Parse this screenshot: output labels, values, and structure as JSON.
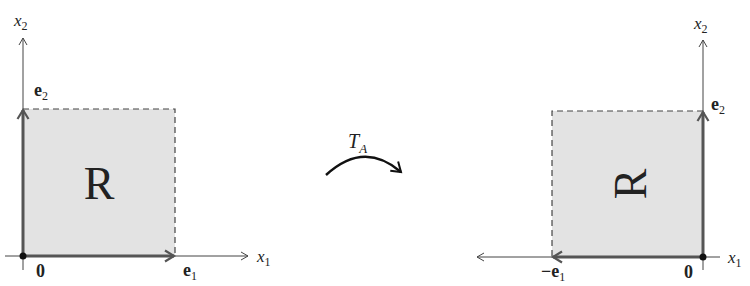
{
  "colors": {
    "fill": "#e3e3e3",
    "vector": "#555555",
    "axis": "#444444",
    "text": "#222222"
  },
  "left_panel": {
    "axis_x_label": "x",
    "axis_x_sub": "1",
    "axis_y_label": "x",
    "axis_y_sub": "2",
    "region_label": "R",
    "origin_label": "0",
    "vec1_label": "e",
    "vec1_sub": "1",
    "vec2_label": "e",
    "vec2_sub": "2"
  },
  "transform": {
    "label": "T",
    "label_sub": "A"
  },
  "right_panel": {
    "axis_x_label": "x",
    "axis_x_sub": "1",
    "axis_y_label": "x",
    "axis_y_sub": "2",
    "region_label": "R",
    "origin_label": "0",
    "vec1_label": "−e",
    "vec1_sub": "1",
    "vec2_label": "e",
    "vec2_sub": "2"
  }
}
